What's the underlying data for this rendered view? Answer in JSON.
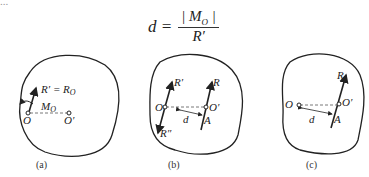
{
  "top_partial_text": "...",
  "formula": {
    "lhs": "d =",
    "numerator": "| M",
    "numerator_sub": "O",
    "numerator_end": " |",
    "denominator": "R′"
  },
  "figures": [
    {
      "caption": "(a)",
      "labels": {
        "force": "R′ = R",
        "force_sub": "O",
        "moment": "M",
        "moment_sub": "O",
        "point_o": "O",
        "point_o2": "O′"
      }
    },
    {
      "caption": "(b)",
      "labels": {
        "r1": "R′",
        "r2": "R″",
        "r": "R",
        "point_o": "O",
        "point_o2": "O′",
        "d": "d",
        "a": "A"
      }
    },
    {
      "caption": "(c)",
      "labels": {
        "r": "R",
        "point_o": "O",
        "point_o2": "O′",
        "d": "d",
        "a": "A"
      }
    }
  ]
}
